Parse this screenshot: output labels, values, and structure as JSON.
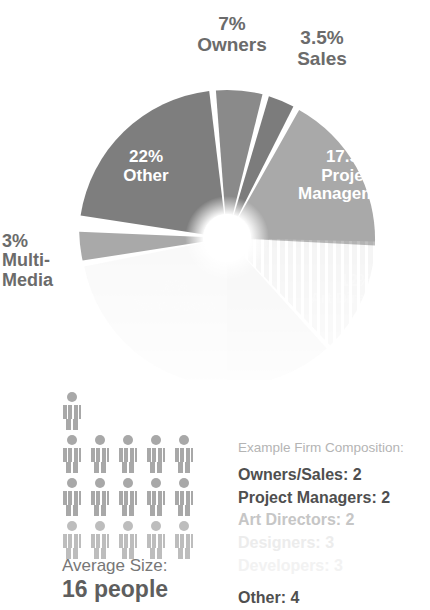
{
  "chart_data": {
    "type": "pie",
    "title": "",
    "units": "percent",
    "center": {
      "cx": 227,
      "cy": 238,
      "r": 148,
      "hole_r": 24
    },
    "categories": [
      "Owners",
      "Sales",
      "Project Management",
      "Art Directors",
      "Developers",
      "Designers",
      "Multi-Media",
      "Other"
    ],
    "values": [
      7,
      3.5,
      17.5,
      12,
      18,
      17,
      3,
      22
    ],
    "slices": [
      {
        "label": "Owners",
        "percent": "7%",
        "value": 7,
        "color": "#8a8a8a",
        "label_position": "outside-top",
        "faded": false
      },
      {
        "label": "Sales",
        "percent": "3.5%",
        "value": 3.5,
        "color": "#7c7c7c",
        "label_position": "outside-top-right",
        "faded": false
      },
      {
        "label": "Project Management",
        "percent": "17.5%",
        "value": 17.5,
        "color": "#a9a9a9",
        "label_position": "inside",
        "faded": false
      },
      {
        "label": "Art Directors",
        "percent": "12%",
        "value": 12,
        "color": "#d0d0d0",
        "pattern": "vertical-stripes",
        "label_position": "inside",
        "faded": true
      },
      {
        "label": "Developers",
        "percent": "18%",
        "value": 18,
        "color": "#ededed",
        "label_position": "inside",
        "faded": true
      },
      {
        "label": "Designers",
        "percent": "17%",
        "value": 17,
        "color": "#f4f4f4",
        "label_position": "inside",
        "faded": true
      },
      {
        "label": "Multi-Media",
        "percent": "3%",
        "value": 3,
        "color": "#a9a9a9",
        "label_position": "outside-left",
        "faded": false
      },
      {
        "label": "Other",
        "percent": "22%",
        "value": 22,
        "color": "#7e7e7e",
        "label_position": "inside",
        "faded": false
      }
    ],
    "legend_position": "bottom-right",
    "grid": false
  },
  "callouts": {
    "owners": {
      "percent": "7%",
      "name": "Owners"
    },
    "sales": {
      "percent": "3.5%",
      "name": "Sales"
    },
    "multimedia": {
      "percent": "3%",
      "name_line1": "Multi-",
      "name_line2": "Media"
    }
  },
  "inner_labels": {
    "other": {
      "percent": "22%",
      "name": "Other"
    },
    "project": {
      "percent": "17.5%",
      "name_line1": "Project",
      "name_line2": "Management"
    },
    "artdir": {
      "percent": "12%",
      "name": "Art Directors"
    },
    "designers": {
      "percent": "18%",
      "name": "Developers"
    }
  },
  "people": {
    "rows": [
      1,
      5,
      5,
      5
    ],
    "total": 16,
    "avg_caption": "Average Size:",
    "avg_value": "16 people",
    "icon": "person-pictogram"
  },
  "legend": {
    "title": "Example Firm Composition:",
    "items": [
      {
        "text": "Owners/Sales: 2",
        "fade": "none"
      },
      {
        "text": "Project Managers: 2",
        "fade": "none"
      },
      {
        "text": "Art Directors: 2",
        "fade": "light"
      },
      {
        "text": "Designers: 3",
        "fade": "lighter"
      },
      {
        "text": "Developers: 3",
        "fade": "lightest"
      },
      {
        "text": "Other: 4",
        "fade": "none"
      }
    ]
  },
  "colors": {
    "text_dark": "#4f4f4f",
    "text_gray": "#6e6e6e",
    "text_light": "#b4b4b4",
    "slice_dark": "#7e7e7e",
    "slice_mid": "#8a8a8a",
    "slice_light": "#a9a9a9",
    "background": "#ffffff"
  }
}
